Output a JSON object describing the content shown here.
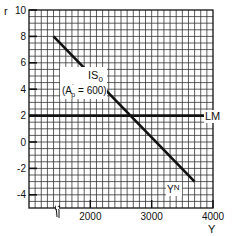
{
  "chart_data": {
    "type": "line",
    "title": "",
    "xlabel": "Y",
    "ylabel": "r",
    "xlim": [
      1000,
      4000
    ],
    "ylim": [
      -5,
      10
    ],
    "x_ticks": [
      2000,
      3000,
      4000
    ],
    "x_tick_labels": [
      "2000",
      "3000",
      "4000"
    ],
    "y_ticks": [
      -4,
      -2,
      0,
      2,
      4,
      6,
      8,
      10
    ],
    "y_tick_labels": [
      "-4",
      "-2",
      "0",
      "2",
      "4",
      "6",
      "8",
      "10"
    ],
    "grid": true,
    "grid_spacing": {
      "x": 100,
      "y": 0.5
    },
    "axis_break": "x-axis break mark near Y=1500",
    "series": [
      {
        "name": "IS0",
        "label": "IS",
        "subscript": "0",
        "annotation": "(A′p = 600)",
        "x": [
          1400,
          3700
        ],
        "y": [
          8,
          -3
        ],
        "style": "thick solid"
      },
      {
        "name": "LM",
        "label": "LM",
        "x": [
          1000,
          4000
        ],
        "y": [
          2,
          2
        ],
        "style": "thick solid horizontal"
      }
    ],
    "annotations": [
      {
        "text": "YN",
        "x": 3450,
        "y": -2.7
      }
    ]
  },
  "labels": {
    "ylabel": "r",
    "xlabel": "Y",
    "is_label": "IS",
    "is_sub": "0",
    "is_param_open": "(A",
    "is_param_prime": "´",
    "is_param_sub": "p",
    "is_param_rest": " = 600)",
    "lm_label": "LM",
    "yn_label": "Y",
    "yn_sup": "N"
  }
}
